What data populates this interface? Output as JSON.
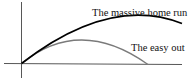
{
  "diagram": {
    "title": "",
    "curves": [
      {
        "id": "home-run",
        "label": "The massive home run",
        "color": "#000000"
      },
      {
        "id": "easy-out",
        "label": "The easy out",
        "color": "#7a7a7a"
      }
    ],
    "axes": {
      "color": "#333333"
    }
  }
}
